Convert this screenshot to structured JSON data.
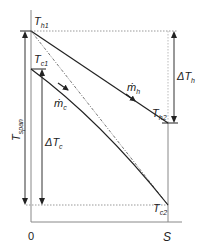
{
  "diagram": {
    "type": "temperature-profile",
    "labels": {
      "t_h1": "T",
      "t_h1_sub": "h1",
      "t_h2": "T",
      "t_h2_sub": "h2",
      "t_c1": "T",
      "t_c1_sub": "c1",
      "t_c2": "T",
      "t_c2_sub": "c2",
      "m_h": "ṁ",
      "m_h_sub": "h",
      "m_c": "ṁ",
      "m_c_sub": "c",
      "delta_t_h": "ΔT",
      "delta_t_h_sub": "h",
      "delta_t_c": "ΔT",
      "delta_t_c_sub": "c",
      "t_span": "T",
      "t_span_sub": "span",
      "x_origin": "0",
      "x_end": "S"
    },
    "colors": {
      "line": "#222222",
      "axis": "#777777",
      "dotted": "#888888"
    }
  }
}
